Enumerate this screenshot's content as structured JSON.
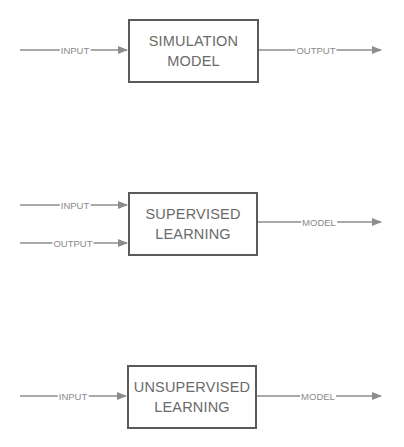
{
  "colors": {
    "box_border": "#5a5a5a",
    "box_text": "#6a6a6a",
    "arrow": "#8c8c8c",
    "label_text": "#8a8a8a",
    "background": "#ffffff"
  },
  "diagrams": [
    {
      "name": "simulation",
      "box": {
        "line1": "SIMULATION",
        "line2": "MODEL"
      },
      "inputs": [
        {
          "label": "INPUT"
        }
      ],
      "outputs": [
        {
          "label": "OUTPUT"
        }
      ]
    },
    {
      "name": "supervised",
      "box": {
        "line1": "SUPERVISED",
        "line2": "LEARNING"
      },
      "inputs": [
        {
          "label": "INPUT"
        },
        {
          "label": "OUTPUT"
        }
      ],
      "outputs": [
        {
          "label": "MODEL"
        }
      ]
    },
    {
      "name": "unsupervised",
      "box": {
        "line1": "UNSUPERVISED",
        "line2": "LEARNING"
      },
      "inputs": [
        {
          "label": "INPUT"
        }
      ],
      "outputs": [
        {
          "label": "MODEL"
        }
      ]
    }
  ]
}
